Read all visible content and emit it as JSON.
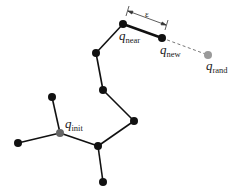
{
  "diagram": {
    "labels": {
      "q_near": {
        "base": "q",
        "sub": "near"
      },
      "q_new": {
        "base": "q",
        "sub": "new"
      },
      "q_rand": {
        "base": "q",
        "sub": "rand"
      },
      "q_init": {
        "base": "q",
        "sub": "init"
      },
      "epsilon": "ε"
    },
    "colors": {
      "node": "#111111",
      "edge": "#111111",
      "highlight_node": "#777777",
      "rand_node": "#9a9a9a",
      "dashed_edge": "#777777"
    },
    "nodes": [
      {
        "id": "q_near",
        "x": 123,
        "y": 24
      },
      {
        "id": "q_new",
        "x": 162,
        "y": 38
      },
      {
        "id": "q_rand",
        "x": 208,
        "y": 55
      },
      {
        "id": "n_a",
        "x": 96,
        "y": 53
      },
      {
        "id": "n_b",
        "x": 103,
        "y": 90
      },
      {
        "id": "n_c",
        "x": 134,
        "y": 121
      },
      {
        "id": "n_d",
        "x": 98,
        "y": 146
      },
      {
        "id": "q_init",
        "x": 60,
        "y": 133
      },
      {
        "id": "n_e",
        "x": 52,
        "y": 97
      },
      {
        "id": "n_f",
        "x": 18,
        "y": 143
      },
      {
        "id": "n_g",
        "x": 103,
        "y": 182
      }
    ],
    "edges": [
      [
        "q_init",
        "n_e"
      ],
      [
        "q_init",
        "n_f"
      ],
      [
        "q_init",
        "n_d"
      ],
      [
        "n_d",
        "n_g"
      ],
      [
        "n_d",
        "n_c"
      ],
      [
        "n_c",
        "n_b"
      ],
      [
        "n_b",
        "n_a"
      ],
      [
        "n_a",
        "q_near"
      ],
      [
        "q_near",
        "q_new"
      ]
    ],
    "dashed_edges": [
      [
        "q_new",
        "q_rand"
      ]
    ]
  }
}
